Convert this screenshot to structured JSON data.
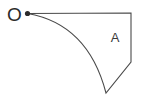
{
  "figure": {
    "title": "",
    "background_color": "#ffffff",
    "stroke_color": "#4a4a4a",
    "dot_color": "#2b2b2b",
    "text_color": "#2b2b2b",
    "width": 149,
    "height": 98,
    "labels": {
      "origin": "O",
      "region": "A"
    },
    "points": {
      "origin_dot": {
        "x": 27.5,
        "y": 13.5
      },
      "top_right_corner": {
        "x": 131,
        "y": 13
      },
      "right_bend": {
        "x": 131,
        "y": 62
      },
      "bottom_vertex": {
        "x": 106,
        "y": 93
      }
    },
    "label_positions": {
      "origin": {
        "x": 14.5,
        "y": 14.5
      },
      "region": {
        "x": 115,
        "y": 37
      }
    },
    "arc": {
      "start": {
        "x": 27.5,
        "y": 13.5
      },
      "end": {
        "x": 106,
        "y": 93
      },
      "control": {
        "x": 88,
        "y": 24
      },
      "description": "concave-up curve sweeping from origin dot down to bottom vertex"
    },
    "outline_path": "M 27.5 13.5 L 131 13 L 131 62 L 106 93 Q 88 24 27.5 13.5 Z"
  }
}
